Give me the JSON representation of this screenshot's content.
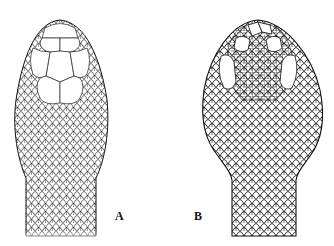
{
  "figure": {
    "panels": [
      {
        "label": "A",
        "description": "Head with large plate-like dorsal shields (internasals, prefrontals, frontal, parietals) and small keeled scales on neck"
      },
      {
        "label": "B",
        "description": "Head covered with many small irregular scales, with supraocular shields and keeled body scales"
      }
    ]
  },
  "colors": {
    "ink": "#111111",
    "background": "#ffffff"
  }
}
